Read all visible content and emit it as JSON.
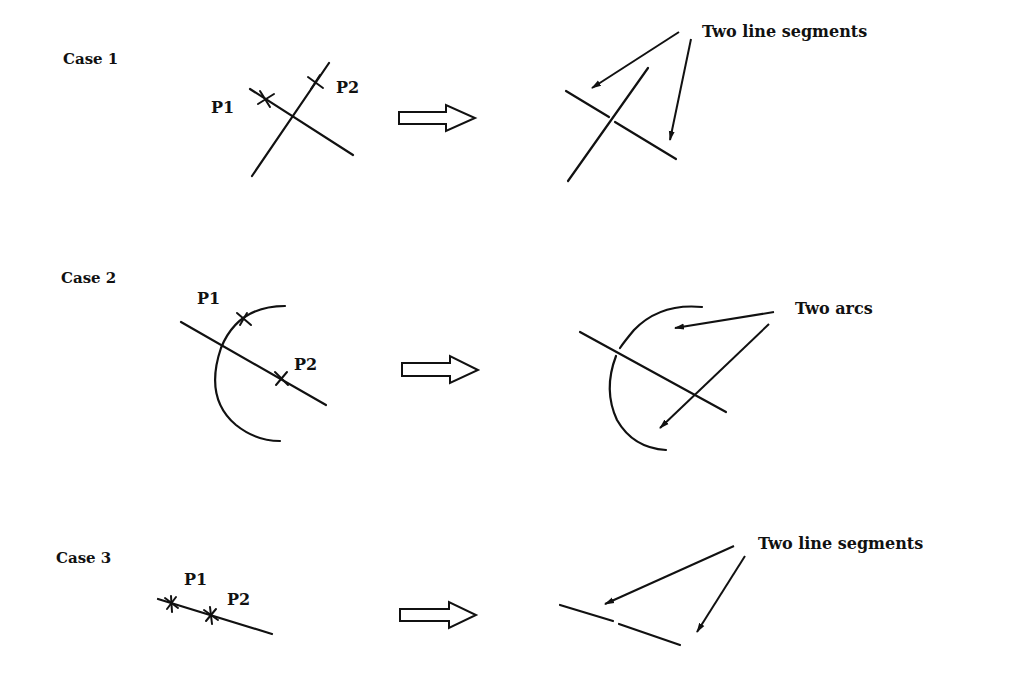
{
  "figure": {
    "cases": [
      {
        "label": "Case 1",
        "points": [
          "P1",
          "P2"
        ],
        "before": "Two crossing lines with picks P1 and P2",
        "result_annotation": "Two line segments"
      },
      {
        "label": "Case 2",
        "points": [
          "P1",
          "P2"
        ],
        "before": "Arc crossed by a line with picks P1 (on arc) and P2 (on line)",
        "result_annotation": "Two arcs"
      },
      {
        "label": "Case 3",
        "points": [
          "P1",
          "P2"
        ],
        "before": "Single line with picks P1 and P2",
        "result_annotation": "Two line segments"
      }
    ],
    "transform_arrow": "hollow-right-arrow",
    "colors": {
      "ink": "#111111",
      "background": "#ffffff"
    }
  }
}
